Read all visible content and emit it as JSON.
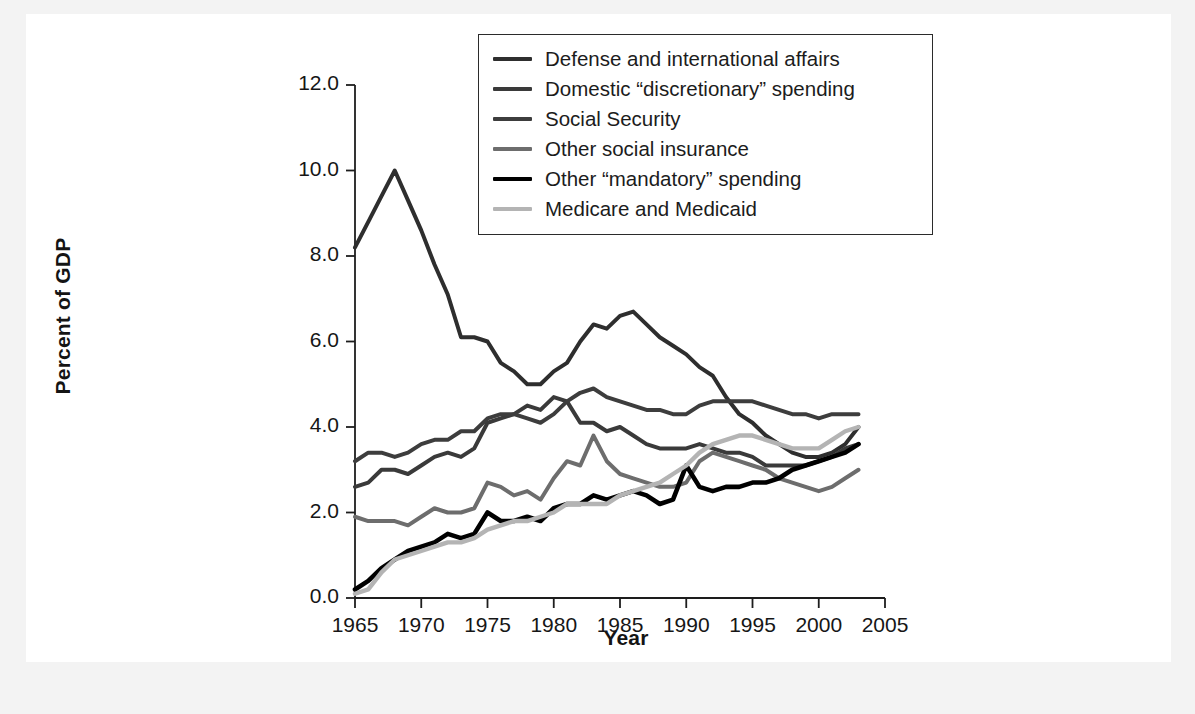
{
  "chart_data": {
    "type": "line",
    "title": "",
    "xlabel": "Year",
    "ylabel": "Percent of GDP",
    "xlim": [
      1965,
      2005
    ],
    "ylim": [
      0.0,
      12.0
    ],
    "xticks": [
      "1965",
      "1970",
      "1975",
      "1980",
      "1985",
      "1990",
      "1995",
      "2000",
      "2005"
    ],
    "yticks": [
      "0.0",
      "2.0",
      "4.0",
      "6.0",
      "8.0",
      "10.0",
      "12.0"
    ],
    "grid": false,
    "legend_position": "top-center",
    "x": [
      1965,
      1966,
      1967,
      1968,
      1969,
      1970,
      1971,
      1972,
      1973,
      1974,
      1975,
      1976,
      1977,
      1978,
      1979,
      1980,
      1981,
      1982,
      1983,
      1984,
      1985,
      1986,
      1987,
      1988,
      1989,
      1990,
      1991,
      1992,
      1993,
      1994,
      1995,
      1996,
      1997,
      1998,
      1999,
      2000,
      2001,
      2002,
      2003
    ],
    "series": [
      {
        "name": "Defense and international affairs",
        "color": "#2e2e2e",
        "width": 4.0,
        "values": [
          8.2,
          8.8,
          9.4,
          10.0,
          9.3,
          8.6,
          7.8,
          7.1,
          6.1,
          6.1,
          6.0,
          5.5,
          5.3,
          5.0,
          5.0,
          5.3,
          5.5,
          6.0,
          6.4,
          6.3,
          6.6,
          6.7,
          6.4,
          6.1,
          5.9,
          5.7,
          5.4,
          5.2,
          4.7,
          4.3,
          4.1,
          3.8,
          3.6,
          3.4,
          3.3,
          3.3,
          3.4,
          3.6,
          4.0
        ]
      },
      {
        "name": "Domestic “discretionary” spending",
        "color": "#3a3a3a",
        "width": 4.0,
        "values": [
          2.6,
          2.7,
          3.0,
          3.0,
          2.9,
          3.1,
          3.3,
          3.4,
          3.3,
          3.5,
          4.1,
          4.2,
          4.3,
          4.5,
          4.4,
          4.7,
          4.6,
          4.1,
          4.1,
          3.9,
          4.0,
          3.8,
          3.6,
          3.5,
          3.5,
          3.5,
          3.6,
          3.5,
          3.4,
          3.4,
          3.3,
          3.1,
          3.1,
          3.1,
          3.1,
          3.2,
          3.3,
          3.5,
          3.6
        ]
      },
      {
        "name": "Social Security",
        "color": "#3d3d3d",
        "width": 4.0,
        "values": [
          3.2,
          3.4,
          3.4,
          3.3,
          3.4,
          3.6,
          3.7,
          3.7,
          3.9,
          3.9,
          4.2,
          4.3,
          4.3,
          4.2,
          4.1,
          4.3,
          4.6,
          4.8,
          4.9,
          4.7,
          4.6,
          4.5,
          4.4,
          4.4,
          4.3,
          4.3,
          4.5,
          4.6,
          4.6,
          4.6,
          4.6,
          4.5,
          4.4,
          4.3,
          4.3,
          4.2,
          4.3,
          4.3,
          4.3
        ]
      },
      {
        "name": "Other social insurance",
        "color": "#6d6d6d",
        "width": 4.0,
        "values": [
          1.9,
          1.8,
          1.8,
          1.8,
          1.7,
          1.9,
          2.1,
          2.0,
          2.0,
          2.1,
          2.7,
          2.6,
          2.4,
          2.5,
          2.3,
          2.8,
          3.2,
          3.1,
          3.8,
          3.2,
          2.9,
          2.8,
          2.7,
          2.6,
          2.6,
          2.7,
          3.2,
          3.4,
          3.3,
          3.2,
          3.1,
          3.0,
          2.8,
          2.7,
          2.6,
          2.5,
          2.6,
          2.8,
          3.0
        ]
      },
      {
        "name": "Other “mandatory” spending",
        "color": "#000000",
        "width": 4.6,
        "values": [
          0.2,
          0.4,
          0.7,
          0.9,
          1.1,
          1.2,
          1.3,
          1.5,
          1.4,
          1.5,
          2.0,
          1.8,
          1.8,
          1.9,
          1.8,
          2.1,
          2.2,
          2.2,
          2.4,
          2.3,
          2.4,
          2.5,
          2.4,
          2.2,
          2.3,
          3.1,
          2.6,
          2.5,
          2.6,
          2.6,
          2.7,
          2.7,
          2.8,
          3.0,
          3.1,
          3.2,
          3.3,
          3.4,
          3.6
        ]
      },
      {
        "name": "Medicare and Medicaid",
        "color": "#b4b4b4",
        "width": 4.4,
        "values": [
          0.1,
          0.2,
          0.6,
          0.9,
          1.0,
          1.1,
          1.2,
          1.3,
          1.3,
          1.4,
          1.6,
          1.7,
          1.8,
          1.8,
          1.9,
          2.0,
          2.2,
          2.2,
          2.2,
          2.2,
          2.4,
          2.5,
          2.6,
          2.7,
          2.9,
          3.1,
          3.4,
          3.6,
          3.7,
          3.8,
          3.8,
          3.7,
          3.6,
          3.5,
          3.5,
          3.5,
          3.7,
          3.9,
          4.0
        ]
      }
    ]
  },
  "legend": {
    "items": [
      {
        "label": "Defense and international affairs"
      },
      {
        "label": "Domestic “discretionary” spending"
      },
      {
        "label": "Social Security"
      },
      {
        "label": "Other social insurance"
      },
      {
        "label": "Other “mandatory” spending"
      },
      {
        "label": "Medicare and Medicaid"
      }
    ]
  }
}
